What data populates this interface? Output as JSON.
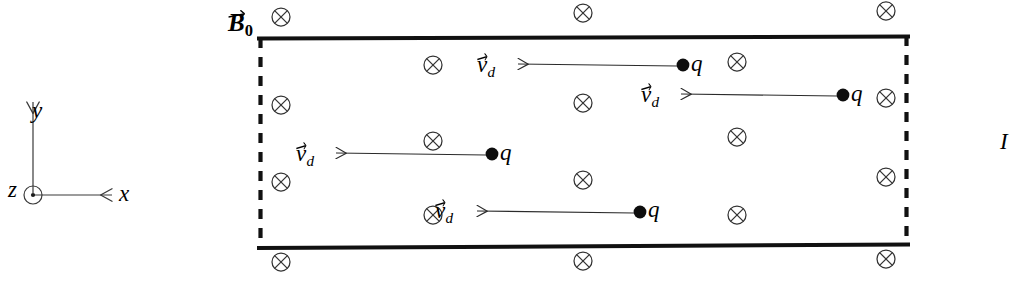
{
  "figure": {
    "background_color": "#ffffff",
    "line_color": "#000000",
    "field_symbol_color": "#333333",
    "width": 1024,
    "height": 281
  },
  "labels": {
    "magnetic_field": {
      "symbol": "B",
      "subscript": "0",
      "vector": true,
      "text": "B⃗₀"
    },
    "current": {
      "symbol": "I",
      "text": "I"
    },
    "axis_x": "x",
    "axis_y": "y",
    "axis_z": "z",
    "drift_velocity": {
      "symbol": "v",
      "subscript": "d",
      "vector": true,
      "text": "v⃗_d"
    },
    "charge": "q"
  },
  "axes": {
    "name": "coordinate-axes",
    "origin": {
      "x": 33,
      "y": 195
    },
    "x_axis": {
      "label": "x",
      "direction": "right",
      "tip": {
        "x": 112,
        "y": 195
      }
    },
    "y_axis": {
      "label": "y",
      "direction": "up",
      "tip": {
        "x": 33,
        "y": 102
      }
    },
    "z_axis": {
      "label": "z",
      "direction": "out-of-page",
      "glyph": "circle-dot"
    }
  },
  "conductor": {
    "name": "conductor-slab",
    "left": 259,
    "right": 908,
    "top": 38,
    "bottom": 249,
    "top_edge_style": "solid",
    "bottom_edge_style": "solid",
    "left_edge_style": "dashed",
    "right_edge_style": "dashed",
    "edge_width_px": 4
  },
  "field": {
    "name": "magnetic-field-into-page",
    "glyph": "circle-cross",
    "direction": "into-page",
    "symbol_radius": 9,
    "positions": [
      {
        "x": 281,
        "y": 17
      },
      {
        "x": 583,
        "y": 13
      },
      {
        "x": 886,
        "y": 11
      },
      {
        "x": 433,
        "y": 65
      },
      {
        "x": 737,
        "y": 62
      },
      {
        "x": 583,
        "y": 103
      },
      {
        "x": 886,
        "y": 98
      },
      {
        "x": 281,
        "y": 105
      },
      {
        "x": 433,
        "y": 141
      },
      {
        "x": 737,
        "y": 137
      },
      {
        "x": 281,
        "y": 182
      },
      {
        "x": 583,
        "y": 180
      },
      {
        "x": 886,
        "y": 177
      },
      {
        "x": 433,
        "y": 215
      },
      {
        "x": 737,
        "y": 215
      },
      {
        "x": 281,
        "y": 262
      },
      {
        "x": 583,
        "y": 261
      },
      {
        "x": 886,
        "y": 259
      }
    ]
  },
  "charges": [
    {
      "id": 1,
      "label": "q",
      "dot": {
        "x": 683,
        "y": 65
      },
      "velocity_label": "v⃗_d",
      "arrow": {
        "from_x": 677,
        "to_x": 518,
        "y": 66
      },
      "direction": "left"
    },
    {
      "id": 2,
      "label": "q",
      "dot": {
        "x": 843,
        "y": 95
      },
      "velocity_label": "v⃗_d",
      "arrow": {
        "from_x": 837,
        "to_x": 681,
        "y": 96
      },
      "direction": "left"
    },
    {
      "id": 3,
      "label": "q",
      "dot": {
        "x": 492,
        "y": 154
      },
      "velocity_label": "v⃗_d",
      "arrow": {
        "from_x": 486,
        "to_x": 336,
        "y": 155
      },
      "direction": "left"
    },
    {
      "id": 4,
      "label": "q",
      "dot": {
        "x": 640,
        "y": 212
      },
      "velocity_label": "v⃗_d",
      "arrow": {
        "from_x": 634,
        "to_x": 477,
        "y": 213
      },
      "direction": "left"
    }
  ]
}
